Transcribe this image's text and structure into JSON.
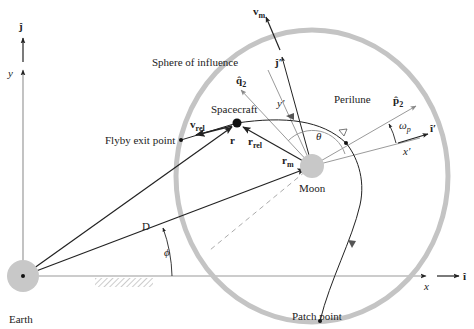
{
  "labels": {
    "earth": "Earth",
    "moon": "Moon",
    "spacecraft": "Spacecraft",
    "sphere_of_influence": "Sphere of influence",
    "flyby_exit_point": "Flyby exit point",
    "perilune": "Perilune",
    "patch_point": "Patch point"
  },
  "axes": {
    "x": "x",
    "y": "y",
    "x_prime": "x′",
    "y_prime": "y′",
    "i_hat": "î",
    "j_hat": "ĵ",
    "i_hat_prime": "î′",
    "j_hat_prime": "ĵ′"
  },
  "vectors": {
    "r": "r",
    "r_rel": "r",
    "r_rel_sub": "rel",
    "r_m": "r",
    "r_m_sub": "m",
    "v_rel": "v",
    "v_rel_sub": "rel",
    "v_m": "v",
    "v_m_sub": "m",
    "q2": "q̂",
    "q2_sub": "2",
    "p2": "p̂",
    "p2_sub": "2"
  },
  "angles": {
    "theta": "θ",
    "phi": "ϕ",
    "omega": "ω",
    "omega_sub": "p",
    "distance": "D"
  },
  "colors": {
    "line": "#222222",
    "gray_line": "#9a9a9a",
    "soi": "#c4c4c4",
    "body_fill": "#c8c8c8"
  }
}
